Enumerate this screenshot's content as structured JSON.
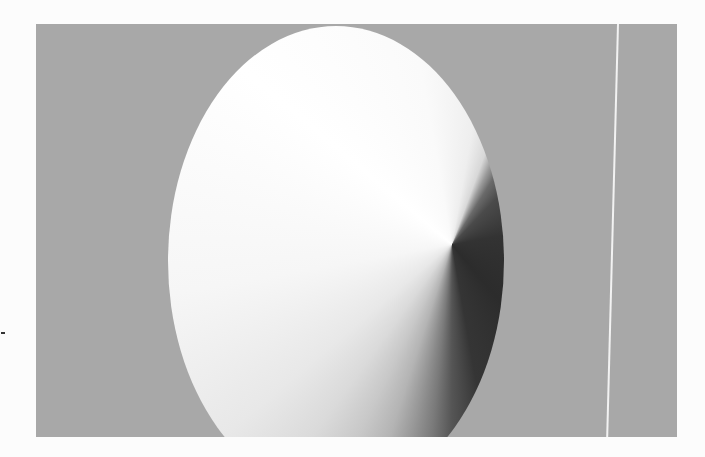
{
  "image": {
    "description": "Gray rectangular panel containing a large vertical oval filled with a stepped conic gradient ranging from white (upper-left) to near-black (lower-right)",
    "colors": {
      "page_background": "#fcfcfc",
      "panel_background": "#a8a8a8",
      "lightest_tone": "#ffffff",
      "darkest_tone": "#2c2c2c",
      "streak": "#f2f2f2"
    },
    "elements": {
      "panel": "gray-panel",
      "oval": "conic-gradient-oval",
      "streak": "vertical-light-streak",
      "dash": "small-dark-mark"
    }
  }
}
